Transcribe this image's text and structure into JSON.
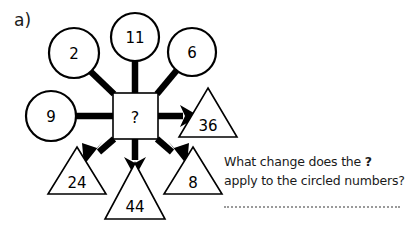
{
  "part_label": "a)",
  "diagram": {
    "type": "function-machine",
    "machine": {
      "symbol": "?",
      "shape": "square"
    },
    "inputs": [
      {
        "value": "2",
        "shape": "circle",
        "position": "top-left"
      },
      {
        "value": "11",
        "shape": "circle",
        "position": "top-center"
      },
      {
        "value": "6",
        "shape": "circle",
        "position": "top-right"
      },
      {
        "value": "9",
        "shape": "circle",
        "position": "left"
      }
    ],
    "outputs": [
      {
        "value": "36",
        "shape": "triangle",
        "position": "right"
      },
      {
        "value": "24",
        "shape": "triangle",
        "position": "bottom-left"
      },
      {
        "value": "44",
        "shape": "triangle",
        "position": "bottom-center"
      },
      {
        "value": "8",
        "shape": "triangle",
        "position": "bottom-right"
      }
    ]
  },
  "question": {
    "line1_before": "What change does the ",
    "line1_bold": "?",
    "line2": "apply to the circled numbers?"
  },
  "colors": {
    "ink": "#000000",
    "text": "#1a1a1a",
    "paper": "#ffffff",
    "answer_rule": "#9a9a9a"
  }
}
